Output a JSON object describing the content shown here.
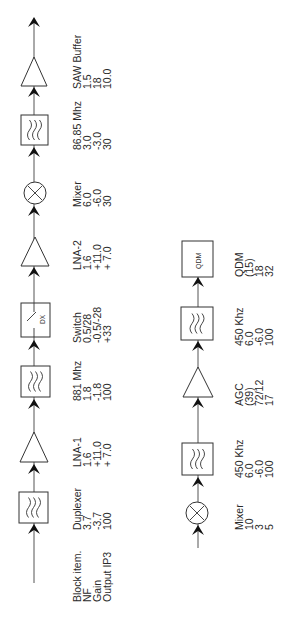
{
  "row_labels": [
    "Block item.",
    "NF",
    "Gain",
    "Output IP3"
  ],
  "upper_chain": [
    {
      "name": "Duplexer",
      "type": "filter",
      "nf": "3.7",
      "gain": "-3.7",
      "ip3": "100"
    },
    {
      "name": "LNA-1",
      "type": "amplifier",
      "nf": "1.6",
      "gain": "+11.0",
      "ip3": "+ 7.0"
    },
    {
      "name": "881 Mhz",
      "type": "filter",
      "nf": "1.8",
      "gain": "-1.8",
      "ip3": "100"
    },
    {
      "name": "Switch",
      "type": "switch",
      "symbol_label": "DX",
      "nf": "0.5/28",
      "gain": "-0.5/-28",
      "ip3": "+33"
    },
    {
      "name": "LNA-2",
      "type": "amplifier",
      "nf": "1.6",
      "gain": "+11.0",
      "ip3": "+ 7.0"
    },
    {
      "name": "Mixer",
      "type": "mixer",
      "nf": "6.0",
      "gain": "-6.0",
      "ip3": "30"
    },
    {
      "name": "86.85 Mhz",
      "type": "filter",
      "nf": "3.0",
      "gain": "-3.0",
      "ip3": "30"
    },
    {
      "name": "SAW Buffer",
      "type": "amplifier",
      "nf": "1.5",
      "gain": "18",
      "ip3": "10.0"
    }
  ],
  "lower_chain": [
    {
      "name": "Mixer",
      "type": "mixer",
      "nf": "10",
      "gain": "3",
      "ip3": "5"
    },
    {
      "name": "450 Khz",
      "type": "filter",
      "nf": "6.0",
      "gain": "-6.0",
      "ip3": "100"
    },
    {
      "name": "AGC",
      "type": "amplifier",
      "nf": "(39)",
      "gain": "72/12",
      "ip3": "17"
    },
    {
      "name": "450 Khz",
      "type": "filter",
      "nf": "6.0",
      "gain": "-6.0",
      "ip3": "100"
    },
    {
      "name": "QDM",
      "type": "block",
      "symbol_label": "QDM",
      "nf": "(15)",
      "gain": "18",
      "ip3": "32"
    }
  ]
}
